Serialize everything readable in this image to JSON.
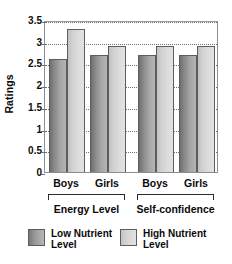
{
  "chart_data": {
    "type": "bar",
    "title": "",
    "xlabel": "",
    "ylabel": "Ratings",
    "ylim": [
      0,
      3.5
    ],
    "ytick_labels": [
      "3.5",
      "3",
      "2.5",
      "2",
      "1.5",
      "1",
      "0.5",
      "0"
    ],
    "ytick_values": [
      3.5,
      3,
      2.5,
      2,
      1.5,
      1,
      0.5,
      0
    ],
    "grid": true,
    "legend_position": "bottom",
    "categories": [
      "Boys",
      "Girls",
      "Boys",
      "Girls"
    ],
    "groups": [
      {
        "label": "Energy Level",
        "categories": [
          "Boys",
          "Girls"
        ]
      },
      {
        "label": "Self-confidence",
        "categories": [
          "Boys",
          "Girls"
        ]
      }
    ],
    "series": [
      {
        "name": "Low Nutrient Level",
        "values": [
          2.6,
          2.7,
          2.7,
          2.7
        ],
        "color": "#8f8f8f"
      },
      {
        "name": "High Nutrient Level",
        "values": [
          3.3,
          2.9,
          2.9,
          2.9
        ],
        "color": "#d8d8d8"
      }
    ]
  },
  "legend": {
    "items": [
      {
        "label": "Low Nutrient\nLevel",
        "swatch": "low"
      },
      {
        "label": "High Nutrient\nLevel",
        "swatch": "high"
      }
    ]
  }
}
